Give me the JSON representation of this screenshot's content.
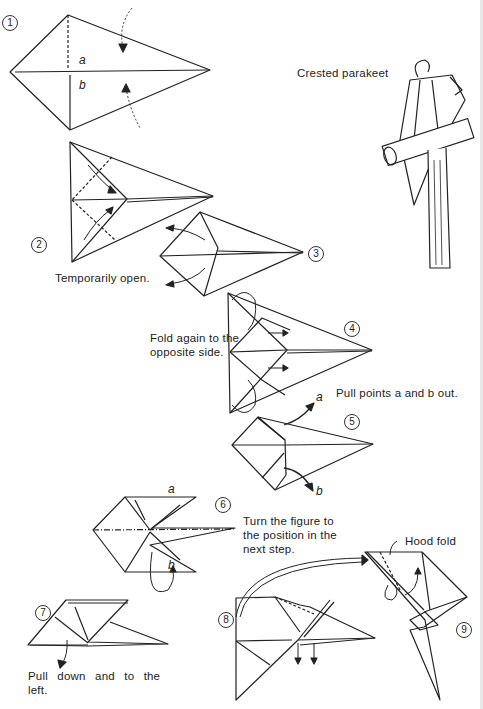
{
  "page": {
    "title": "Crested parakeet",
    "steps": [
      {
        "number": "1",
        "points": [
          "a",
          "b"
        ]
      },
      {
        "number": "2"
      },
      {
        "number": "3",
        "caption": "Temporarily open."
      },
      {
        "number": "4",
        "caption": "Fold again to the opposite side."
      },
      {
        "number": "5",
        "caption": "Pull points a and b out.",
        "points": [
          "a",
          "b"
        ]
      },
      {
        "number": "6",
        "caption": "Turn the figure to the position in the next step.",
        "points": [
          "a",
          "b"
        ]
      },
      {
        "number": "7",
        "caption": "Pull down and to the left."
      },
      {
        "number": "8"
      },
      {
        "number": "9",
        "caption": "Hood fold"
      }
    ],
    "captions": {
      "temporarily_open": "Temporarily open.",
      "fold_again_1": "Fold again to the",
      "fold_again_2": "opposite side.",
      "pull_points": "Pull points a and b out.",
      "turn_1": "Turn the figure to",
      "turn_2": "the position in the",
      "turn_3": "next step.",
      "pull_down_1": "Pull down and to the",
      "pull_down_2": "left.",
      "hood_fold": "Hood fold"
    },
    "labels": {
      "a": "a",
      "b": "b"
    },
    "step_numbers": {
      "s1": "1",
      "s2": "2",
      "s3": "3",
      "s4": "4",
      "s5": "5",
      "s6": "6",
      "s7": "7",
      "s8": "8",
      "s9": "9"
    }
  }
}
